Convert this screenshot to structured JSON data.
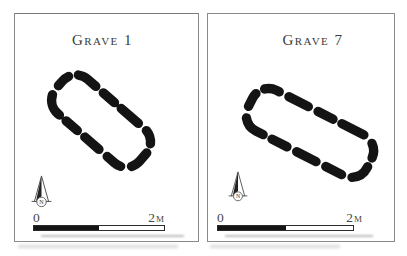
{
  "panels": [
    {
      "title": "Grave 1",
      "compass_label": "N",
      "scale_start": "0",
      "scale_end": "2m"
    },
    {
      "title": "Grave 7",
      "compass_label": "N",
      "scale_start": "0",
      "scale_end": "2m"
    }
  ],
  "colors": {
    "ink": "#141414",
    "border": "#8a8a8a",
    "text": "#3a3a3a",
    "shadow": "#a8a8a8",
    "paper": "#ffffff"
  }
}
